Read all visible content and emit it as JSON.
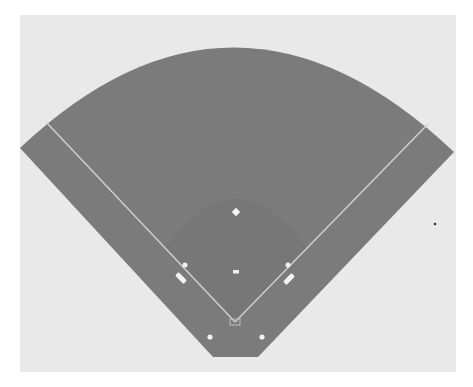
{
  "diagram": {
    "colors": {
      "page": "#ffffff",
      "panel": "#e9e9e9",
      "field": "#7b7b7b",
      "infield": "#747474",
      "lines": "#cfcfcf",
      "markers": "#f2f2f2",
      "stray_dot": "#333333"
    },
    "elements": [
      {
        "name": "second-base",
        "label": "2nd base",
        "x": 236,
        "y": 212
      },
      {
        "name": "pitchers-mound",
        "label": "Pitcher's mound",
        "x": 236,
        "y": 272
      },
      {
        "name": "first-base",
        "label": "1st base",
        "x": 288,
        "y": 265
      },
      {
        "name": "third-base",
        "label": "3rd base",
        "x": 185,
        "y": 265
      },
      {
        "name": "home-plate",
        "label": "Home plate",
        "x": 235,
        "y": 322
      },
      {
        "name": "first-base-coach-box",
        "label": "1st base coach box",
        "x": 289,
        "y": 279
      },
      {
        "name": "third-base-coach-box",
        "label": "3rd base coach box",
        "x": 181,
        "y": 278
      },
      {
        "name": "on-deck-circle-left",
        "label": "On-deck circle",
        "x": 210,
        "y": 337
      },
      {
        "name": "on-deck-circle-right",
        "label": "On-deck circle",
        "x": 262,
        "y": 337
      }
    ]
  }
}
